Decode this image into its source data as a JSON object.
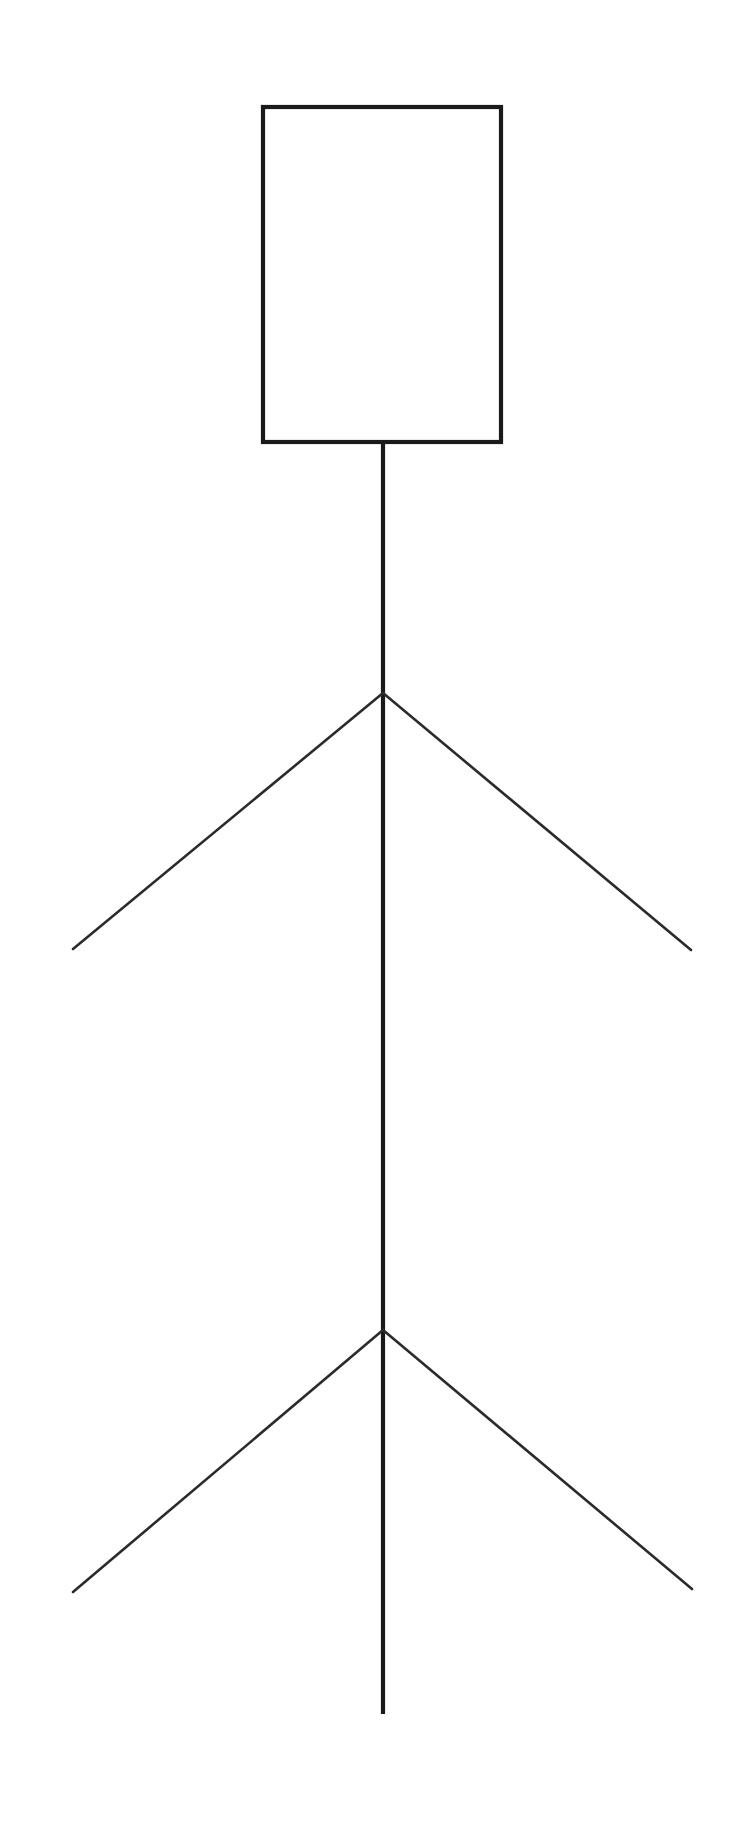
{
  "figure": {
    "background_color": "#ffffff",
    "stroke_color": "#1a1a1a",
    "limb_stroke_color": "#2b2b2b",
    "canvas": {
      "width": 751,
      "height": 1821
    },
    "parts": {
      "head": {
        "label": "head-rectangle",
        "shape": "rectangle",
        "x": 263,
        "y": 107,
        "width": 238,
        "height": 335,
        "stroke_width": 4.2
      },
      "body": {
        "label": "body-line",
        "shape": "line",
        "x1": 383,
        "y1": 442,
        "x2": 383,
        "y2": 1714,
        "stroke_width": 4.2
      },
      "arm_left": {
        "label": "left-arm-line",
        "shape": "line",
        "x1": 383,
        "y1": 693,
        "x2": 73,
        "y2": 949,
        "stroke_width": 2.6
      },
      "arm_right": {
        "label": "right-arm-line",
        "shape": "line",
        "x1": 383,
        "y1": 693,
        "x2": 691,
        "y2": 950,
        "stroke_width": 2.6
      },
      "leg_left": {
        "label": "left-leg-line",
        "shape": "line",
        "x1": 383,
        "y1": 1330,
        "x2": 73,
        "y2": 1592,
        "stroke_width": 2.6
      },
      "leg_right": {
        "label": "right-leg-line",
        "shape": "line",
        "x1": 383,
        "y1": 1330,
        "x2": 692,
        "y2": 1589,
        "stroke_width": 2.6
      }
    }
  }
}
